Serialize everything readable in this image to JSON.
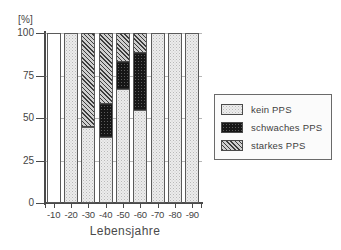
{
  "chart_data": {
    "type": "bar",
    "title": "",
    "subtitle": "",
    "xlabel": "Lebensjahre",
    "ylabel": "[%]",
    "ylim": [
      0,
      100
    ],
    "yticks": [
      0,
      25,
      50,
      75,
      100
    ],
    "ytick_labels": [
      "0",
      "25",
      "50",
      "75",
      "100"
    ],
    "grid": true,
    "stacked": true,
    "legend_position": "right",
    "categories": [
      "-10",
      "-20",
      "-30",
      "-40",
      "-50",
      "-60",
      "-70",
      "-80",
      "-90"
    ],
    "series": [
      {
        "name": "kein PPS",
        "pattern": "light-dotted",
        "color": "#ececec",
        "values": [
          0,
          100,
          45,
          39,
          67,
          55,
          100,
          100,
          100
        ]
      },
      {
        "name": "schwaches PPS",
        "pattern": "solid-black",
        "color": "#161616",
        "values": [
          0,
          0,
          0,
          19,
          16,
          33,
          0,
          0,
          0
        ]
      },
      {
        "name": "starkes PPS",
        "pattern": "diagonal-hatch",
        "color": "#9e9e9e",
        "values": [
          0,
          0,
          55,
          42,
          17,
          12,
          0,
          0,
          0
        ]
      }
    ],
    "empty_categories": [
      "-10"
    ]
  },
  "axes": {
    "y_unit_label": "[%]",
    "y_tick_labels": [
      "100",
      "75",
      "50",
      "25",
      "0"
    ],
    "x_tick_labels": [
      "-10",
      "-20",
      "-30",
      "-40",
      "-50",
      "-60",
      "-70",
      "-80",
      "-90"
    ],
    "x_axis_title": "Lebensjahre"
  },
  "legend": {
    "items": [
      {
        "label": "kein PPS",
        "swatch": "light-dotted-swatch"
      },
      {
        "label": "schwaches PPS",
        "swatch": "solid-black-swatch"
      },
      {
        "label": "starkes PPS",
        "swatch": "diagonal-hatch-swatch"
      }
    ]
  }
}
